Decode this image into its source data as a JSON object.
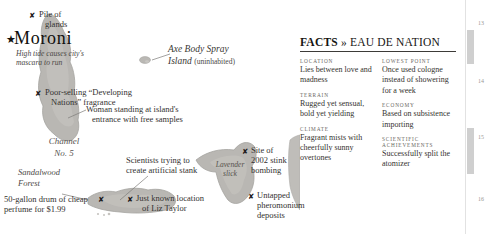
{
  "map": {
    "city": {
      "star": "★",
      "name": "Moroni",
      "subtitle_line1": "High tide causes city's",
      "subtitle_line2": "mascara to run"
    },
    "markers": [
      {
        "glyph": "✘",
        "line1": "Pile of",
        "line2": "glands"
      },
      {
        "glyph": "✘",
        "line1": "Poor-selling “Developing",
        "line2": "Nations” fragrance"
      },
      {
        "glyph": "",
        "line1": "Woman standing at island's",
        "line2": "entrance with free samples"
      },
      {
        "glyph": "",
        "line1": "Scientists trying to",
        "line2": "create artificial stank"
      },
      {
        "glyph": "✘",
        "line1": "50-gallon drum of cheap",
        "line2": "perfume for $1.99"
      },
      {
        "glyph": "✘",
        "line1": "Just known location",
        "line2": "of Liz Taylor"
      },
      {
        "glyph": "✘",
        "line1": "Site of",
        "line2": "2002 stink",
        "line3": "bombing"
      },
      {
        "glyph": "✘",
        "line1": "Untapped",
        "line2": "pheromonium deposits"
      }
    ],
    "labels": {
      "axe_island_line1": "Axe Body Spray",
      "axe_island_line2": "Island",
      "axe_island_note": "(uninhabited)",
      "channel_line1": "Channel",
      "channel_line2": "No. 5",
      "forest_line1": "Sandalwood",
      "forest_line2": "Forest",
      "slick_line1": "Lavender",
      "slick_line2": "slick"
    },
    "colors": {
      "land": "#b9b7b3",
      "land_edge": "#9d9b97",
      "sea": "#ffffff",
      "ink": "#2b2b2b"
    }
  },
  "facts": {
    "heading_bold": "FACTS",
    "heading_guillemet": "»",
    "heading_rest": "EAU DE NATION",
    "left_column": [
      {
        "term": "LOCATION",
        "definition": "Lies between love and madness"
      },
      {
        "term": "TERRAIN",
        "definition": "Rugged yet sensual, bold yet yielding"
      },
      {
        "term": "CLIMATE",
        "definition": "Fragrant mists with cheerfully sunny overtones"
      }
    ],
    "right_column": [
      {
        "term": "LOWEST POINT",
        "definition": "Once used cologne instead of showering for a week"
      },
      {
        "term": "ECONOMY",
        "definition": "Based on subsistence importing"
      },
      {
        "term": "SCIENTIFIC ACHIEVEMENTS",
        "definition": "Successfully split the atomizer"
      }
    ]
  },
  "page_strip": {
    "numbers": [
      "13",
      "14",
      "15",
      "16"
    ]
  }
}
